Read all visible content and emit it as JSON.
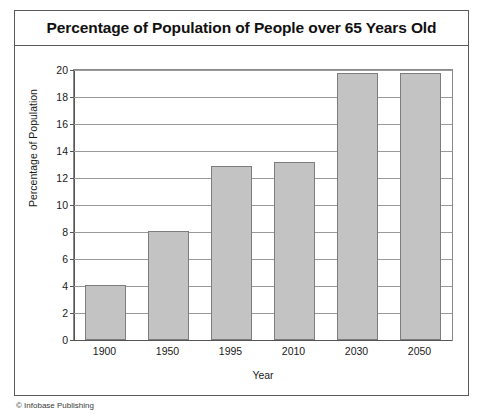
{
  "figure": {
    "title": "Percentage of Population of People over 65 Years Old",
    "credit": "© Infobase Publishing"
  },
  "chart_data": {
    "type": "bar",
    "title": "Percentage of Population of People over 65 Years Old",
    "xlabel": "Year",
    "ylabel": "Percentage of Population",
    "categories": [
      "1900",
      "1950",
      "1995",
      "2010",
      "2030",
      "2050"
    ],
    "values": [
      4.1,
      8.1,
      12.9,
      13.2,
      19.8,
      19.8
    ],
    "ylim": [
      0,
      20
    ],
    "ytick_step": 2,
    "yticks": [
      "20",
      "18",
      "16",
      "14",
      "12",
      "10",
      "8",
      "6",
      "4",
      "2",
      "0"
    ],
    "grid": true,
    "legend": "none",
    "bar_color": "#c3c3c3",
    "bar_border_color": "#7d7d7d"
  }
}
